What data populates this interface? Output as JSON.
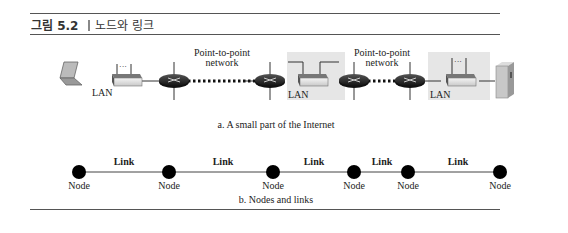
{
  "figure": {
    "number": "그림 5.2",
    "title": "노드와 링크"
  },
  "part_a": {
    "caption": "a. A small part of the Internet",
    "labels": {
      "p2p_1_line1": "Point-to-point",
      "p2p_1_line2": "network",
      "p2p_2_line1": "Point-to-point",
      "p2p_2_line2": "network",
      "lan_1": "LAN",
      "lan_2": "LAN",
      "lan_3": "LAN"
    },
    "devices": [
      "laptop",
      "switch",
      "router",
      "router",
      "switch",
      "router",
      "router",
      "switch",
      "server"
    ]
  },
  "part_b": {
    "caption": "b. Nodes and links",
    "node_label": "Node",
    "link_label": "Link",
    "nodes": [
      "Node",
      "Node",
      "Node",
      "Node",
      "Node",
      "Node"
    ],
    "links": [
      "Link",
      "Link",
      "Link",
      "Link",
      "Link"
    ]
  },
  "colors": {
    "rule": "#555555",
    "lan_shade": "#e4e4e4",
    "router": "#2a2a2a",
    "node": "#000000"
  }
}
